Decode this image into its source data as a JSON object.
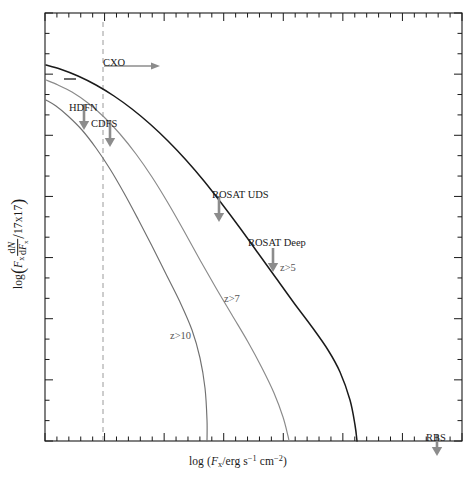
{
  "figure": {
    "kind": "log-log number counts plot",
    "background": "#ffffff",
    "frame": {
      "x0": 45,
      "y0": 13,
      "x1": 462,
      "y1": 441,
      "color": "#1a1a1a"
    }
  },
  "axes": {
    "x": {
      "label_html": "log (<i>F</i><sub>x</sub>/erg s<sup>−1</sup> cm<sup>−2</sup>)",
      "label_text": "log (Fx/erg s-1 cm-2)",
      "scale": "log",
      "range": [
        -17.0,
        -10.0
      ],
      "tick_count_minor": 35,
      "major_every": 5,
      "ticks_labeled": false
    },
    "y": {
      "label_html": "log ( <i>F</i><sub>x</sub> dN/d<i>F</i><sub>x</sub> / 17x17 )",
      "label_text": "log(Fx dN/dFx / 17x17)",
      "scale": "log",
      "range": [
        -3.0,
        4.0
      ],
      "tick_count_minor": 21,
      "major_every": 3,
      "ticks_labeled": false
    },
    "grid": "off",
    "legend": "none (inline curve labels)"
  },
  "colors": {
    "curve_dark": "#1a1a1a",
    "curve_gray": "#8a8a8a",
    "curve_midgray": "#707070",
    "arrow_gray": "#8c8c8c",
    "dashed_line": "#9a9a9a",
    "frame": "#1a1a1a",
    "text": "#1a1a1a"
  },
  "chart_data": {
    "type": "line",
    "title": "",
    "xlabel": "log (Fx/erg s-1 cm-2)",
    "ylabel": "log(Fx dN/dFx / 17x17)",
    "xlim": [
      -17.0,
      -10.0
    ],
    "ylim": [
      -3.0,
      4.0
    ],
    "grid": false,
    "legend_position": "inline",
    "series": [
      {
        "name": "z>5",
        "color": "#1a1a1a",
        "style": "solid",
        "label": "z>5",
        "label_x": -16.1,
        "label_y": 0.42,
        "points_px": [
          [
            46,
            65
          ],
          [
            60,
            69
          ],
          [
            78,
            76
          ],
          [
            96,
            85
          ],
          [
            114,
            96
          ],
          [
            132,
            109
          ],
          [
            150,
            124
          ],
          [
            168,
            141
          ],
          [
            186,
            160
          ],
          [
            204,
            181
          ],
          [
            222,
            204
          ],
          [
            240,
            228
          ],
          [
            258,
            253
          ],
          [
            276,
            278
          ],
          [
            294,
            303
          ],
          [
            312,
            327
          ],
          [
            328,
            350
          ],
          [
            340,
            372
          ],
          [
            350,
            400
          ],
          [
            355,
            425
          ],
          [
            357,
            441
          ]
        ]
      },
      {
        "name": "z>7",
        "color": "#8a8a8a",
        "style": "solid",
        "label": "z>7",
        "label_x": -14.45,
        "label_y": -0.55,
        "points_px": [
          [
            46,
            80
          ],
          [
            58,
            85
          ],
          [
            72,
            92
          ],
          [
            88,
            103
          ],
          [
            104,
            117
          ],
          [
            120,
            134
          ],
          [
            136,
            154
          ],
          [
            152,
            177
          ],
          [
            168,
            203
          ],
          [
            184,
            231
          ],
          [
            200,
            260
          ],
          [
            216,
            288
          ],
          [
            232,
            315
          ],
          [
            248,
            342
          ],
          [
            262,
            368
          ],
          [
            274,
            393
          ],
          [
            283,
            417
          ],
          [
            288,
            436
          ],
          [
            289,
            441
          ]
        ]
      },
      {
        "name": "z>10",
        "color": "#707070",
        "style": "solid",
        "label": "z>10",
        "label_x": -15.35,
        "label_y": -1.2,
        "points_px": [
          [
            46,
            100
          ],
          [
            56,
            106
          ],
          [
            68,
            116
          ],
          [
            82,
            130
          ],
          [
            96,
            148
          ],
          [
            110,
            169
          ],
          [
            124,
            193
          ],
          [
            138,
            219
          ],
          [
            152,
            246
          ],
          [
            166,
            274
          ],
          [
            180,
            302
          ],
          [
            192,
            330
          ],
          [
            200,
            358
          ],
          [
            205,
            388
          ],
          [
            207,
            420
          ],
          [
            207,
            441
          ]
        ]
      }
    ],
    "reference_lines": [
      {
        "name": "CXO sensitivity limit",
        "orientation": "vertical",
        "style": "dashed",
        "color": "#9a9a9a",
        "x_px": 103,
        "y_from_px": 22,
        "y_to_px": 441
      }
    ],
    "annotations": [
      {
        "name": "CXO",
        "text": "CXO",
        "type": "arrow-right",
        "text_x_px": 103,
        "text_y_px": 57,
        "arrow_x_px": 104,
        "arrow_y_px": 66,
        "arrow_len_px": 56
      },
      {
        "name": "HDFN",
        "text": "HDFN",
        "type": "arrow-down",
        "text_x_px": 69,
        "text_y_px": 102,
        "arrow_x_px": 84,
        "arrow_y_px": 104,
        "arrow_len_px": 26
      },
      {
        "name": "CDFS",
        "text": "CDFS",
        "type": "arrow-down",
        "text_x_px": 91,
        "text_y_px": 118,
        "arrow_x_px": 110,
        "arrow_y_px": 120,
        "arrow_len_px": 27
      },
      {
        "name": "ROSAT UDS",
        "text": "ROSAT UDS",
        "type": "arrow-down",
        "text_x_px": 212,
        "text_y_px": 189,
        "arrow_x_px": 219,
        "arrow_y_px": 196,
        "arrow_len_px": 26
      },
      {
        "name": "ROSAT Deep",
        "text": "ROSAT Deep",
        "type": "arrow-down",
        "text_x_px": 248,
        "text_y_px": 237,
        "arrow_x_px": 273,
        "arrow_y_px": 248,
        "arrow_len_px": 24
      },
      {
        "name": "RBS",
        "text": "RBS",
        "type": "arrow-down",
        "text_x_px": 426,
        "text_y_px": 432,
        "arrow_x_px": 437,
        "arrow_y_px": 434,
        "arrow_len_px": 22
      }
    ],
    "curve_labels": [
      {
        "name": "z>5",
        "text": "z>5",
        "x_px": 280,
        "y_px": 262
      },
      {
        "name": "z>7",
        "text": "z>7",
        "x_px": 224,
        "y_px": 293
      },
      {
        "name": "z>10",
        "text": "z>10",
        "x_px": 170,
        "y_px": 330
      }
    ]
  }
}
